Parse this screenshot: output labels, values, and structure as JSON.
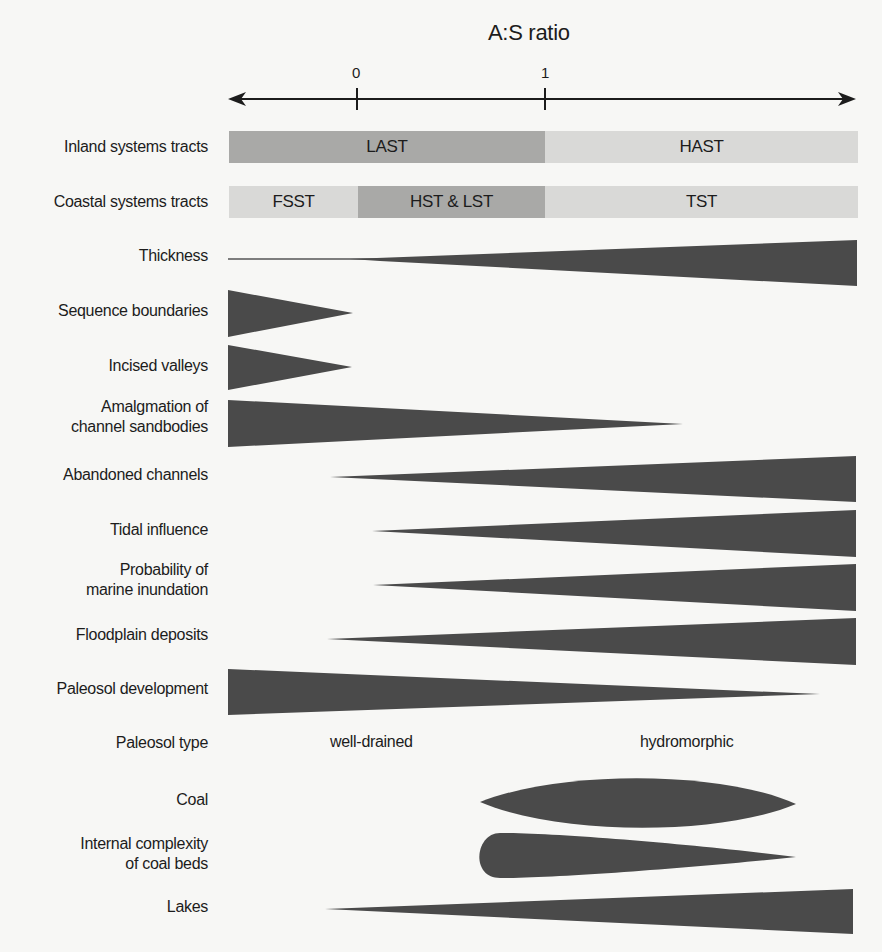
{
  "axis": {
    "title": "A:S ratio",
    "ticks": [
      {
        "label": "0",
        "x": 357
      },
      {
        "label": "1",
        "x": 545
      }
    ]
  },
  "colors": {
    "dark_bar": "#a9a9a7",
    "light_bar": "#d9d9d7",
    "shape_fill": "#4a4a4a",
    "text": "#1c1c1c",
    "background": "#f7f7f5"
  },
  "rows": {
    "inland": {
      "label": "Inland systems tracts",
      "segments": [
        {
          "label": "LAST",
          "shade": "dark"
        },
        {
          "label": "HAST",
          "shade": "light"
        }
      ]
    },
    "coastal": {
      "label": "Coastal systems tracts",
      "segments": [
        {
          "label": "FSST",
          "shade": "light"
        },
        {
          "label": "HST & LST",
          "shade": "dark"
        },
        {
          "label": "TST",
          "shade": "light"
        }
      ]
    },
    "thickness": {
      "label": "Thickness",
      "trend": "increases with A:S ratio"
    },
    "sequence_boundaries": {
      "label": "Sequence boundaries",
      "trend": "decreases, present only at low A:S"
    },
    "incised_valleys": {
      "label": "Incised valleys",
      "trend": "decreases, present only at low A:S"
    },
    "amalgamation": {
      "label_line1": "Amalgmation of",
      "label_line2": "channel sandbodies",
      "trend": "decreases with A:S ratio"
    },
    "abandoned_channels": {
      "label": "Abandoned channels",
      "trend": "increases with A:S ratio"
    },
    "tidal_influence": {
      "label": "Tidal influence",
      "trend": "increases with A:S ratio"
    },
    "marine_inundation": {
      "label_line1": "Probability of",
      "label_line2": "marine inundation",
      "trend": "increases with A:S ratio"
    },
    "floodplain_deposits": {
      "label": "Floodplain deposits",
      "trend": "increases with A:S ratio"
    },
    "paleosol_development": {
      "label": "Paleosol development",
      "trend": "decreases with A:S ratio"
    },
    "paleosol_type": {
      "label": "Paleosol type",
      "low_value": "well-drained",
      "high_value": "hydromorphic"
    },
    "coal": {
      "label": "Coal",
      "trend": "peaks at intermediate-high A:S"
    },
    "coal_complexity": {
      "label_line1": "Internal complexity",
      "label_line2": "of coal beds",
      "trend": "highest at onset, tapering"
    },
    "lakes": {
      "label": "Lakes",
      "trend": "increases with A:S ratio"
    }
  }
}
